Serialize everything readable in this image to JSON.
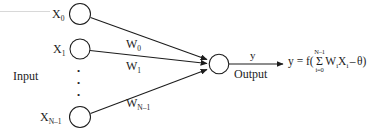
{
  "diagram": {
    "stroke_color": "#1c1c1c",
    "background_color": "#ffffff",
    "input_section_label": "Input",
    "output_section_label": "Output",
    "output_signal_label": "y",
    "vertical_ellipsis": "•",
    "nodes": [
      {
        "id": "x0",
        "label_base": "X",
        "label_sub": "0"
      },
      {
        "id": "x1",
        "label_base": "X",
        "label_sub": "1"
      },
      {
        "id": "xn",
        "label_base": "X",
        "label_sub": "N–1"
      }
    ],
    "weights": [
      {
        "id": "w0",
        "label_base": "W",
        "label_sub": "0"
      },
      {
        "id": "w1",
        "label_base": "W",
        "label_sub": "1"
      },
      {
        "id": "wn",
        "label_base": "W",
        "label_sub": "N–1"
      }
    ],
    "formula": {
      "lhs": "y = f(",
      "sum_sign": "Σ",
      "sum_upper": "N–1",
      "sum_lower": "i=0",
      "weight_symbol": "W",
      "weight_sub": "i",
      "input_symbol": "X",
      "input_sub": "i",
      "operator": "–",
      "threshold": "θ",
      "closing": ")"
    }
  }
}
